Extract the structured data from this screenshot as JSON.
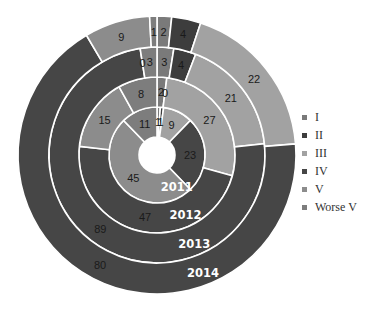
{
  "chart_data": {
    "type": "donut",
    "title": "",
    "categories": [
      "I",
      "II",
      "III",
      "IV",
      "V",
      "Worse V"
    ],
    "colors": [
      "#7a7a7a",
      "#3d3d3d",
      "#a2a2a2",
      "#464646",
      "#8c8c8c",
      "#7d7d7d"
    ],
    "rings_inner_to_outer": [
      "2011",
      "2012",
      "2013",
      "2014"
    ],
    "series": [
      {
        "name": "2011",
        "values": [
          1,
          1,
          9,
          23,
          45,
          11
        ]
      },
      {
        "name": "2012",
        "values": [
          2,
          0,
          27,
          47,
          15,
          8
        ]
      },
      {
        "name": "2013",
        "values": [
          3,
          4,
          21,
          89,
          0,
          3
        ]
      },
      {
        "name": "2014",
        "values": [
          2,
          4,
          22,
          80,
          9,
          1
        ]
      }
    ],
    "legend": {
      "position": "right",
      "entries": [
        "I",
        "II",
        "III",
        "IV",
        "V",
        "Worse V"
      ]
    },
    "data_labels": true
  }
}
